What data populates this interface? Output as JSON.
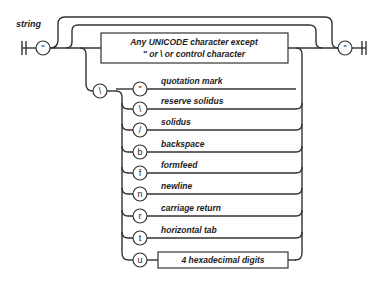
{
  "diagram": {
    "title": "string",
    "start_quote": "\"",
    "end_quote": "\"",
    "char_box": {
      "line1": "Any UNICODE character except",
      "line2": "\" or \\ or control character"
    },
    "escape_symbol": "\\",
    "escapes": [
      {
        "symbol": "\"",
        "label": "quotation mark"
      },
      {
        "symbol": "\\",
        "label": "reserve solidus"
      },
      {
        "symbol": "/",
        "label": "solidus"
      },
      {
        "symbol": "b",
        "label": "backspace"
      },
      {
        "symbol": "f",
        "label": "formfeed"
      },
      {
        "symbol": "n",
        "label": "newline"
      },
      {
        "symbol": "r",
        "label": "carriage return"
      },
      {
        "symbol": "t",
        "label": "horizontal tab"
      },
      {
        "symbol": "u",
        "label": ""
      }
    ],
    "hex_box": "4 hexadecimal digits",
    "colors": {
      "line": "#333333",
      "background": "#ffffff",
      "text": "#222222"
    }
  }
}
